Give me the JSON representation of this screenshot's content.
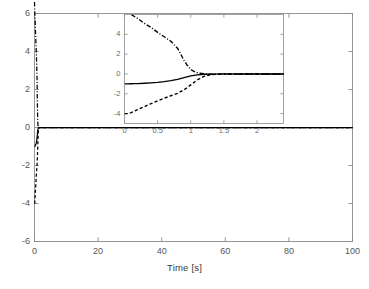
{
  "figure": {
    "background": "#ffffff",
    "axis_color": "#8c8c8c",
    "line_color": "#000000"
  },
  "chart_data": {
    "type": "line",
    "title": "",
    "subtitle": "",
    "xlabel": "Time [s]",
    "ylabel": "",
    "xlim": [
      0,
      100
    ],
    "ylim": [
      -6,
      6
    ],
    "xticks": [
      0,
      20,
      40,
      60,
      80,
      100
    ],
    "yticks": [
      -6,
      -4,
      -2,
      0,
      2,
      4,
      6
    ],
    "xticklabels": [
      "0",
      "20",
      "40",
      "60",
      "80",
      "100"
    ],
    "yticklabels": [
      "-6",
      "-4",
      "-2",
      "0",
      "2",
      "4",
      "6"
    ],
    "grid": false,
    "legend": null,
    "series": [
      {
        "name": "state-1",
        "style": "solid",
        "color": "#000000",
        "x": [
          0,
          0.05,
          0.1,
          0.15,
          0.2,
          0.3,
          0.4,
          0.5,
          0.6,
          0.7,
          0.8,
          0.9,
          1.0,
          1.1,
          1.2,
          1.3,
          1.5,
          1.8,
          2.1,
          2.5,
          3,
          4,
          6,
          10,
          20,
          40,
          60,
          80,
          100
        ],
        "y": [
          -1.0,
          -1.0,
          -0.99,
          -0.98,
          -0.97,
          -0.94,
          -0.9,
          -0.85,
          -0.78,
          -0.68,
          -0.55,
          -0.38,
          -0.2,
          -0.09,
          -0.03,
          -0.01,
          0.0,
          0.0,
          0.0,
          0.0,
          0.0,
          0.0,
          0.0,
          0.0,
          0.0,
          0.0,
          0.0,
          0.0,
          0.0
        ]
      },
      {
        "name": "state-2",
        "style": "dashed",
        "color": "#000000",
        "x": [
          0,
          0.05,
          0.1,
          0.15,
          0.2,
          0.3,
          0.4,
          0.5,
          0.6,
          0.7,
          0.8,
          0.9,
          1.0,
          1.1,
          1.2,
          1.3,
          1.5,
          1.8,
          2.1,
          2.5,
          3,
          4,
          6,
          10,
          20,
          40,
          60,
          80,
          100
        ],
        "y": [
          -4.0,
          -4.0,
          -3.9,
          -3.75,
          -3.6,
          -3.3,
          -3.0,
          -2.72,
          -2.45,
          -2.2,
          -1.95,
          -1.6,
          -1.1,
          -0.6,
          -0.25,
          -0.08,
          0.0,
          0.0,
          0.0,
          0.0,
          0.0,
          0.0,
          0.0,
          0.0,
          0.0,
          0.0,
          0.0,
          0.0,
          0.0
        ]
      },
      {
        "name": "state-3",
        "style": "dashdot",
        "color": "#000000",
        "x": [
          0,
          0.05,
          0.1,
          0.15,
          0.2,
          0.3,
          0.4,
          0.5,
          0.6,
          0.7,
          0.8,
          0.85,
          0.9,
          0.95,
          1.0,
          1.05,
          1.1,
          1.2,
          1.3,
          1.5,
          1.8,
          2.1,
          2.5,
          3,
          4,
          6,
          10,
          20,
          40,
          60,
          80,
          100
        ],
        "y": [
          6.6,
          6.3,
          6.0,
          5.8,
          5.6,
          5.1,
          4.7,
          4.2,
          3.75,
          3.3,
          2.6,
          2.0,
          1.35,
          0.85,
          0.45,
          0.25,
          0.12,
          0.02,
          -0.02,
          -0.02,
          -0.01,
          0.0,
          0.0,
          0.0,
          0.0,
          0.0,
          0.0,
          0.0,
          0.0,
          0.0,
          0.0,
          0.0
        ]
      }
    ],
    "inset": {
      "type": "line",
      "xlim": [
        0,
        2.4
      ],
      "ylim": [
        -5,
        6
      ],
      "xticks": [
        0,
        0.5,
        1,
        1.5,
        2
      ],
      "yticks": [
        -4,
        -2,
        0,
        2,
        4
      ],
      "xticklabels": [
        "0",
        "0.5",
        "1",
        "1.5",
        "2"
      ],
      "yticklabels": [
        "-4",
        "-2",
        "0",
        "2",
        "4"
      ],
      "grid": false,
      "note": "zoomed view of the first 2.4 seconds of the main plot"
    }
  }
}
